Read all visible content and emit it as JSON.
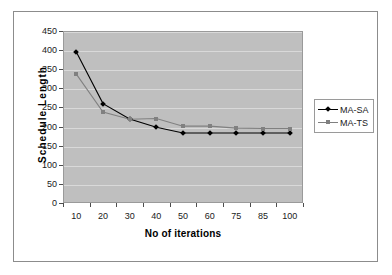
{
  "chart_data": {
    "type": "line",
    "title": "",
    "xlabel": "No of iterations",
    "ylabel": "Schedule Length",
    "categories": [
      "10",
      "20",
      "30",
      "40",
      "50",
      "60",
      "75",
      "85",
      "100"
    ],
    "series": [
      {
        "name": "MA-SA",
        "marker": "diamond",
        "color": "#000000",
        "values": [
          395,
          260,
          220,
          198,
          183,
          183,
          183,
          183,
          183
        ]
      },
      {
        "name": "MA-TS",
        "marker": "square",
        "color": "#808080",
        "values": [
          337,
          238,
          219,
          221,
          201,
          201,
          196,
          195,
          195
        ]
      }
    ],
    "ylim": [
      0,
      450
    ],
    "ytick_step": 50,
    "yticks": [
      "450",
      "400",
      "350",
      "300",
      "250",
      "200",
      "150",
      "100",
      "50",
      "0"
    ],
    "grid": true,
    "grid_axis": "y",
    "legend_position": "right",
    "plot_background": "#bfbfbf",
    "page_background": "#ffffff"
  },
  "legend": {
    "entries": [
      {
        "label": "MA-SA"
      },
      {
        "label": "MA-TS"
      }
    ]
  }
}
